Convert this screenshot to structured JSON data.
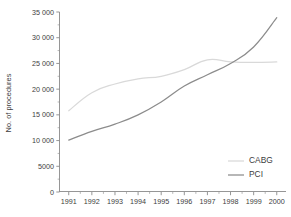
{
  "chart_data": {
    "type": "line",
    "title": "",
    "xlabel": "",
    "ylabel": "No. of procedures",
    "categories": [
      "1991",
      "1992",
      "1993",
      "1994",
      "1995",
      "1996",
      "1997",
      "1998",
      "1999",
      "2000"
    ],
    "x": [
      1991,
      1992,
      1993,
      1994,
      1995,
      1996,
      1997,
      1998,
      1999,
      2000
    ],
    "xlim": [
      1990.6,
      2000.4
    ],
    "ylim": [
      0,
      35000
    ],
    "grid": false,
    "legend_position": "bottom-right",
    "series": [
      {
        "name": "CABG",
        "color": "#d9d9d9",
        "values": [
          15800,
          19300,
          21000,
          22000,
          22500,
          23800,
          25700,
          25300,
          25200,
          25300
        ]
      },
      {
        "name": "PCI",
        "color": "#8c8c8c",
        "values": [
          10100,
          11800,
          13200,
          15000,
          17500,
          20600,
          22800,
          25000,
          28200,
          33900
        ]
      }
    ],
    "y_ticks": [
      0,
      5000,
      10000,
      15000,
      20000,
      25000,
      30000,
      35000
    ],
    "y_tick_labels": [
      "0",
      "5000",
      "10 000",
      "15 000",
      "20 000",
      "25 000",
      "30 000",
      "35 000"
    ],
    "x_ticks": [
      1991,
      1992,
      1993,
      1994,
      1995,
      1996,
      1997,
      1998,
      1999,
      2000
    ],
    "x_tick_labels": [
      "1991",
      "1992",
      "1993",
      "1994",
      "1995",
      "1996",
      "1997",
      "1998",
      "1999",
      "2000"
    ]
  },
  "legend": {
    "items": [
      {
        "label": "CABG",
        "color": "#d9d9d9"
      },
      {
        "label": "PCI",
        "color": "#8c8c8c"
      }
    ]
  },
  "axes": {
    "y_title": "No. of procedures"
  },
  "colors": {
    "axis": "#8a8a8a",
    "text": "#3d3d3d",
    "background": "#ffffff",
    "cabg": "#d9d9d9",
    "pci": "#8c8c8c"
  }
}
